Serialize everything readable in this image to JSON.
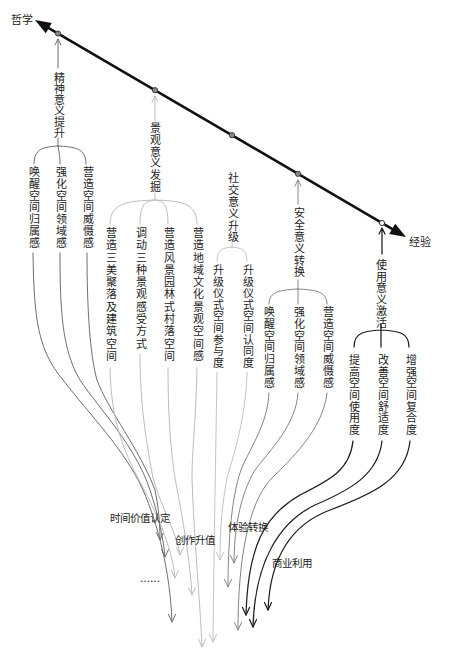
{
  "axis": {
    "left_label": "哲学",
    "right_label": "经验",
    "color": "#111111"
  },
  "dimensions": [
    {
      "label": "精神意义提升",
      "color": "#6e6e6e",
      "items": [
        "唤醒空间归属感",
        "强化空间领域感",
        "营造空间威慑感"
      ]
    },
    {
      "label": "景观意义发掘",
      "color": "#bdbdbd",
      "items": [
        "营造三美聚落及建筑空间",
        "调动三种景观感受方式",
        "营造风景园林式村落空间",
        "营造地域文化景观空间感"
      ]
    },
    {
      "label": "社交意义升级",
      "color": "#c4c4c4",
      "items": [
        "升级仪式空间参与度",
        "升级仪式空间认同度"
      ]
    },
    {
      "label": "安全意义转换",
      "color": "#858585",
      "items": [
        "唤醒空间归属感",
        "强化空间领域感",
        "营造空间威慑感"
      ]
    },
    {
      "label": "使用意义激活",
      "color": "#1e1e1e",
      "items": [
        "提高空间使用度",
        "改善空间舒适度",
        "增强空间复合度"
      ]
    }
  ],
  "outcomes": {
    "time_value": "时间价值认定",
    "creative_appreciation": "创作升值",
    "experience_conversion": "体验转换",
    "commercial_use": "商业利用",
    "more": "......"
  }
}
